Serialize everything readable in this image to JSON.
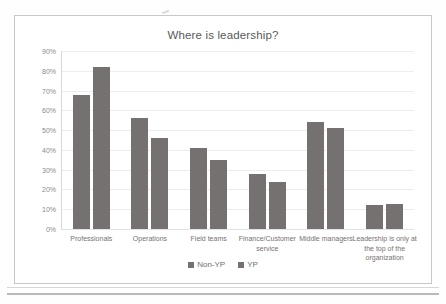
{
  "chart": {
    "title": "Where is leadership?",
    "frame_border_color": "#c8c8c8",
    "bar_color": "#767171",
    "gridline_color": "#ededed"
  },
  "legend": {
    "position": "bottom",
    "items": [
      {
        "label": "Non-YP",
        "color": "#767171",
        "swatch_icon": "square-swatch-icon"
      },
      {
        "label": "YP",
        "color": "#767171",
        "swatch_icon": "square-swatch-icon"
      }
    ]
  },
  "y_axis": {
    "ticks": [
      "90%",
      "80%",
      "70%",
      "60%",
      "50%",
      "40%",
      "30%",
      "20%",
      "10%",
      "0%"
    ],
    "min": 0,
    "max": 90
  },
  "chart_data": {
    "type": "bar",
    "title": "Where is leadership?",
    "xlabel": "",
    "ylabel": "",
    "ylim": [
      0,
      90
    ],
    "ytick_labels": [
      "0%",
      "10%",
      "20%",
      "30%",
      "40%",
      "50%",
      "60%",
      "70%",
      "80%",
      "90%"
    ],
    "grid": true,
    "legend_position": "bottom",
    "categories": [
      "Professionals",
      "Operations",
      "Field teams",
      "Finance/Customer service",
      "Middle managers",
      "Leadership is only at the top of the organization"
    ],
    "series": [
      {
        "name": "Non-YP",
        "color": "#767171",
        "values": [
          68,
          56,
          41,
          28,
          54,
          12
        ]
      },
      {
        "name": "YP",
        "color": "#767171",
        "values": [
          82,
          46,
          35,
          24,
          51,
          12.5
        ]
      }
    ]
  }
}
